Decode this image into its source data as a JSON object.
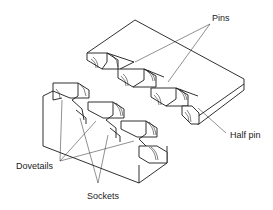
{
  "diagram": {
    "labels": {
      "pins": "Pins",
      "half_pin": "Half pin",
      "dovetails": "Dovetails",
      "sockets": "Sockets"
    },
    "parts": [
      {
        "name": "pin-board",
        "description": "Upper-right board with pins and half pin cut on its end"
      },
      {
        "name": "tail-board",
        "description": "Lower-left board with dovetails and sockets cut on its end"
      }
    ],
    "colors": {
      "line": "#1a1a1a",
      "background": "#ffffff"
    }
  }
}
